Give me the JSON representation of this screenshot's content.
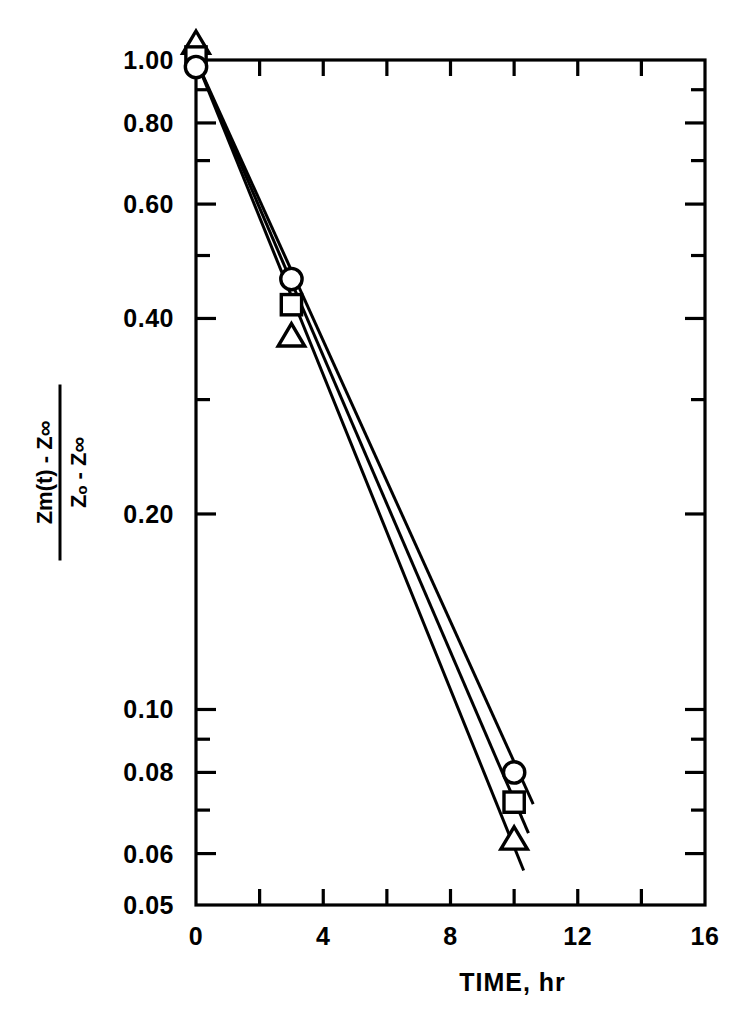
{
  "chart_data": {
    "type": "line",
    "title": "",
    "subtitle": "",
    "xlabel": "TIME, hr",
    "ylabel_numerator": "Zm(t) - Z∞",
    "ylabel_denominator": "Zₒ - Z∞",
    "xscale": "linear",
    "yscale": "log",
    "xlim": [
      0,
      16
    ],
    "ylim": [
      0.05,
      1.0
    ],
    "grid": false,
    "legend_position": "none",
    "x_major_ticks": [
      0,
      4,
      8,
      12,
      16
    ],
    "x_major_tick_labels": [
      "0",
      "4",
      "8",
      "12",
      "16"
    ],
    "x_minor_ticks": [
      2,
      6,
      10,
      14
    ],
    "y_ticks": [
      0.05,
      0.06,
      0.08,
      0.1,
      0.2,
      0.4,
      0.6,
      0.8,
      1.0
    ],
    "y_tick_labels": [
      "0.05",
      "0.06",
      "0.08",
      "0.10",
      "0.20",
      "0.40",
      "0.60",
      "0.80",
      "1.00"
    ],
    "y_minor_ticks": [
      0.07,
      0.09,
      0.3,
      0.5,
      0.7,
      0.9
    ],
    "series": [
      {
        "name": "series-circle",
        "marker": "circle",
        "x": [
          0,
          3,
          10
        ],
        "values": [
          1.0,
          0.46,
          0.08
        ],
        "fit_line": {
          "x": [
            0,
            10.6
          ],
          "y": [
            1.0,
            0.0715
          ]
        }
      },
      {
        "name": "series-square",
        "marker": "square",
        "x": [
          0,
          3,
          10
        ],
        "values": [
          1.0,
          0.42,
          0.072
        ],
        "fit_line": {
          "x": [
            0,
            10.45
          ],
          "y": [
            1.0,
            0.0645
          ]
        }
      },
      {
        "name": "series-triangle",
        "marker": "triangle",
        "x": [
          0,
          3,
          10
        ],
        "values": [
          1.0,
          0.375,
          0.063
        ],
        "fit_line": {
          "x": [
            0,
            10.3
          ],
          "y": [
            1.0,
            0.0565
          ]
        }
      }
    ]
  },
  "axes": {
    "x_axis_name": "time-axis",
    "y_axis_name": "normalized-concentration-axis"
  },
  "style": {
    "line_color": "#000000",
    "marker_edge_color": "#000000",
    "marker_face_color": "#ffffff",
    "background": "#ffffff"
  }
}
